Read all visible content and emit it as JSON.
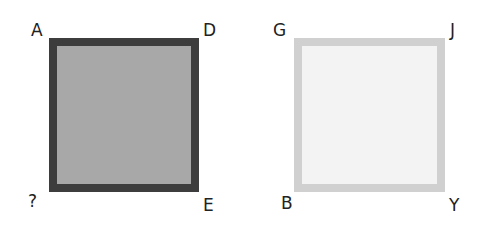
{
  "squares": [
    {
      "name": "left-square",
      "border_color": "#3d3d3d",
      "fill_color": "#a8a8a8",
      "corners": {
        "top_left": "A",
        "top_right": "D",
        "bottom_left": "?",
        "bottom_right": "E"
      }
    },
    {
      "name": "right-square",
      "border_color": "#d0d0d0",
      "fill_color": "#f3f3f3",
      "corners": {
        "top_left": "G",
        "top_right": "J",
        "bottom_left": "B",
        "bottom_right": "Y"
      }
    }
  ]
}
